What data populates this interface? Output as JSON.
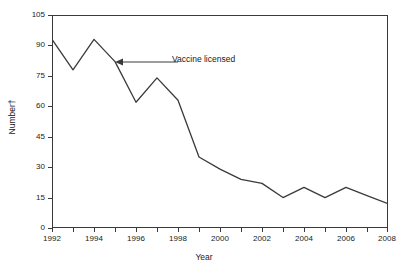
{
  "chart_data": {
    "type": "line",
    "title": "",
    "xlabel": "Year",
    "ylabel": "Number†",
    "x": [
      1992,
      1993,
      1994,
      1995,
      1996,
      1997,
      1998,
      1999,
      2000,
      2001,
      2002,
      2003,
      2004,
      2005,
      2006,
      2007,
      2008
    ],
    "values": [
      93,
      78,
      93,
      82,
      62,
      74,
      63,
      35,
      29,
      24,
      22,
      15,
      20,
      15,
      20,
      16,
      12
    ],
    "series": [
      {
        "name": "Number",
        "values": [
          93,
          78,
          93,
          82,
          62,
          74,
          63,
          35,
          29,
          24,
          22,
          15,
          20,
          15,
          20,
          16,
          12
        ]
      }
    ],
    "xlim": [
      1992,
      2008
    ],
    "ylim": [
      0,
      105
    ],
    "yticks": [
      0,
      15,
      30,
      45,
      60,
      75,
      90,
      105
    ],
    "ytick_labels": [
      "0",
      "15",
      "30",
      "45",
      "60",
      "75",
      "90",
      "105"
    ],
    "xticks": [
      1992,
      1993,
      1994,
      1995,
      1996,
      1997,
      1998,
      1999,
      2000,
      2001,
      2002,
      2003,
      2004,
      2005,
      2006,
      2007,
      2008
    ],
    "xtick_labels_shown": [
      "1992",
      "1994",
      "1996",
      "1998",
      "2000",
      "2002",
      "2004",
      "2006",
      "2008"
    ],
    "xtick_labels_shown_values": [
      1992,
      1994,
      1996,
      1998,
      2000,
      2002,
      2004,
      2006,
      2008
    ],
    "grid": false,
    "legend": "none",
    "annotations": [
      {
        "text": "Vaccine licensed",
        "points_to_x": 1995,
        "points_to_y": 82,
        "arrow": "left"
      }
    ],
    "line_color": "#3a3a3a",
    "background_color": "#ffffff",
    "axis_color": "#3a3a3a"
  },
  "axes": {
    "x_title": "Year",
    "y_title": "Number†"
  },
  "annotation": {
    "text": "Vaccine licensed"
  }
}
